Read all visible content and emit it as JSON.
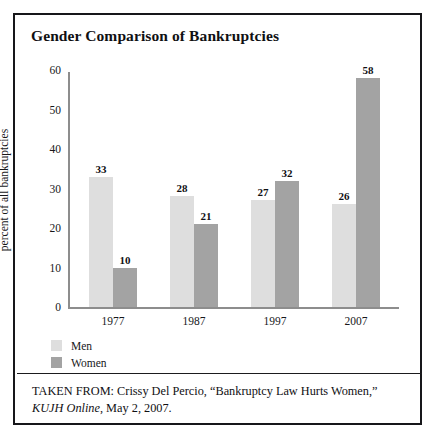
{
  "chart_data": {
    "type": "bar",
    "title": "Gender Comparison of Bankruptcies",
    "xlabel": "",
    "ylabel": "percent of all bankruptcies",
    "categories": [
      "1977",
      "1987",
      "1997",
      "2007"
    ],
    "series": [
      {
        "name": "Men",
        "color": "#dedede",
        "values": [
          33,
          28,
          27,
          26
        ]
      },
      {
        "name": "Women",
        "color": "#a3a3a3",
        "values": [
          10,
          21,
          32,
          58
        ]
      }
    ],
    "ylim": [
      0,
      60
    ],
    "yticks": [
      0,
      10,
      20,
      30,
      40,
      50,
      60
    ],
    "grid": false,
    "legend_position": "bottom-left",
    "data_labels": true
  },
  "legend": {
    "items": [
      {
        "label": "Men"
      },
      {
        "label": "Women"
      }
    ]
  },
  "source": {
    "prefix": "TAKEN FROM: Crissy Del Percio, “Bankruptcy Law Hurts Women,”",
    "publication": "KUJH Online",
    "suffix": ", May 2, 2007."
  }
}
